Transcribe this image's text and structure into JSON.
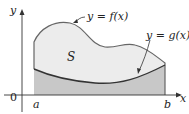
{
  "diagram": {
    "axis_x_label": "x",
    "axis_y_label": "y",
    "origin_label": "0",
    "a_label": "a",
    "b_label": "b",
    "region_label": "S",
    "f_label": "y = f(x)",
    "g_label": "y = g(x)",
    "colors": {
      "region_upper": "#ececec",
      "region_lower": "#c8c8c8",
      "curve": "#555555"
    }
  }
}
